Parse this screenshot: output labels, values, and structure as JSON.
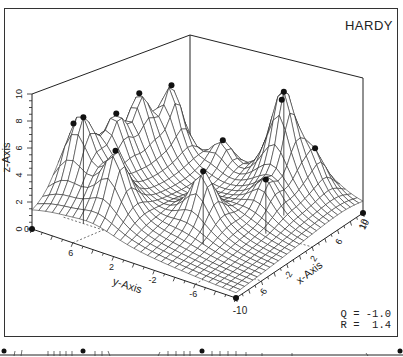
{
  "chart_data": {
    "type": "surface3d",
    "title": "HARDY",
    "xlabel": "x-Axis",
    "ylabel": "y-Axis",
    "zlabel": "z-Axis",
    "z_ticks": [
      "0",
      "2",
      "4",
      "6",
      "8",
      "10"
    ],
    "y_ticks": [
      "6",
      "2",
      "-2",
      "-6"
    ],
    "x_ticks": [
      "-6",
      "-2",
      "2",
      "6",
      "10"
    ],
    "corner_labels": [
      "0",
      "-10",
      "10"
    ],
    "zlim": [
      0,
      10
    ],
    "xlim": [
      -10,
      10
    ],
    "ylim": [
      -10,
      10
    ],
    "parameters": {
      "Q": "-1.0",
      "R": "1.4"
    },
    "data_points_marked": 13
  },
  "labels": {
    "title": "HARDY",
    "params_text": "Q = -1.0\nR =  1.4",
    "z_axis": "z-Axis",
    "y_axis": "y-Axis",
    "x_axis": "x-Axis"
  }
}
